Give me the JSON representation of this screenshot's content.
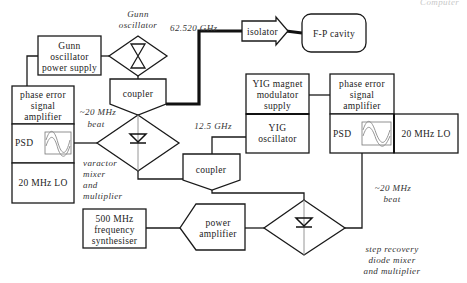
{
  "diagram": {
    "corner_label": "Computer",
    "gunn_oscillator_label": [
      "Gunn",
      "oscillator"
    ],
    "freq_62": "62.520 GHz",
    "gunn_power_supply": [
      "Gunn",
      "oscillator",
      "power supply"
    ],
    "isolator": "isolator",
    "fp_cavity": "F-P cavity",
    "coupler_top": "coupler",
    "coupler_mid": "coupler",
    "left_stack": {
      "amplifier": [
        "phase error",
        "signal",
        "amplifier"
      ],
      "psd": "PSD",
      "lo": "20 MHz LO"
    },
    "beat_left": [
      "~20 MHz",
      "beat"
    ],
    "varactor_label": [
      "varactor",
      "mixer",
      "and",
      "multiplier"
    ],
    "freq_12": "12.5 GHz",
    "yig_supply": [
      "YIG magnet",
      "modulator",
      "supply"
    ],
    "yig_osc": [
      "YIG",
      "oscillator"
    ],
    "right_stack": {
      "amplifier": [
        "phase error",
        "signal",
        "amplifier"
      ],
      "psd": "PSD",
      "lo": "20 MHz LO"
    },
    "beat_right": [
      "~20 MHz",
      "beat"
    ],
    "synthesiser": [
      "500 MHz",
      "frequency",
      "synthesiser"
    ],
    "power_amp": [
      "power",
      "amplifier"
    ],
    "srd_label": [
      "step recovery",
      "diode mixer",
      "and multiplier"
    ]
  }
}
